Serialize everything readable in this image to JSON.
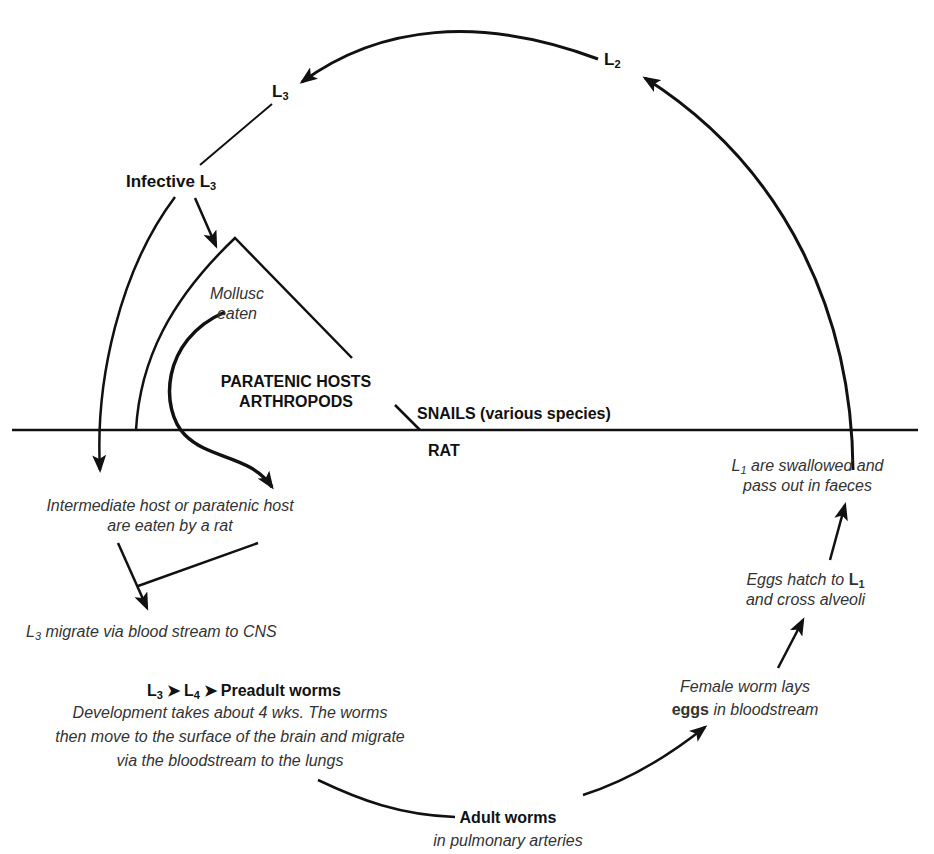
{
  "stages": {
    "l2": {
      "letter": "L",
      "sub": "2"
    },
    "l3": {
      "letter": "L",
      "sub": "3"
    },
    "infective_l3": {
      "text": "Infective ",
      "letter": "L",
      "sub": "3"
    }
  },
  "hosts": {
    "mollusc_eaten": [
      "Mollusc",
      "eaten"
    ],
    "paratenic": [
      "PARATENIC HOSTS",
      "ARTHROPODS"
    ],
    "snails": "SNAILS (various species)",
    "rat": "RAT"
  },
  "steps": {
    "eaten_by_rat": [
      "Intermediate host or paratenic host",
      "are eaten by a rat"
    ],
    "migrate_cns": {
      "letter": "L",
      "sub": "3",
      "text": " migrate via blood stream to CNS"
    },
    "development": {
      "header": {
        "a": "L",
        "a_sub": "3",
        "b": "L",
        "b_sub": "4",
        "c": "Preadult worms",
        "arrow": "➤"
      },
      "lines": [
        "Development takes about 4 wks. The worms",
        "then move to the surface of the brain and migrate",
        "via the bloodstream to the lungs"
      ]
    },
    "adult": {
      "title": "Adult worms",
      "sub": "in pulmonary arteries"
    },
    "female_lays": {
      "line1": "Female worm lays",
      "bold": "eggs",
      "line2_rest": " in bloodstream"
    },
    "eggs_hatch": {
      "line1": "Eggs hatch to ",
      "bold": "L",
      "bold_sub": "1",
      "line2": "and cross alveoli"
    },
    "swallowed": {
      "letter": "L",
      "sub": "1",
      "line1_rest": " are swallowed and",
      "line2": "pass out in faeces"
    }
  },
  "colors": {
    "ink": "#111111",
    "background": "#ffffff"
  }
}
